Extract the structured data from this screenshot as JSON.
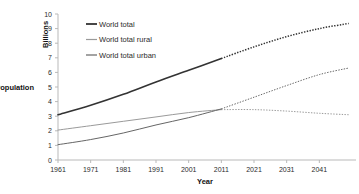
{
  "chart_data": {
    "type": "line",
    "title": "",
    "xlabel": "Year",
    "ylabel": "Population",
    "yunit": "Billions",
    "xlim": [
      1961,
      2051
    ],
    "ylim": [
      0,
      10
    ],
    "xticks": [
      "1961",
      "1971",
      "1981",
      "1991",
      "2001",
      "2011",
      "2021",
      "2031",
      "2041"
    ],
    "yticks": [
      "0",
      "1",
      "2",
      "3",
      "4",
      "5",
      "6",
      "7",
      "8",
      "9",
      "10"
    ],
    "grid": false,
    "legend_position": "upper-left-inside",
    "projection_start_year": 2011,
    "x": [
      1961,
      1971,
      1981,
      1991,
      2001,
      2011,
      2021,
      2031,
      2041,
      2050
    ],
    "series": [
      {
        "name": "World total",
        "color": "#333333",
        "values": [
          3.1,
          3.75,
          4.5,
          5.35,
          6.15,
          6.95,
          7.75,
          8.45,
          9.0,
          9.35
        ]
      },
      {
        "name": "World total rural",
        "color": "#9a9a9a",
        "values": [
          2.05,
          2.35,
          2.65,
          2.95,
          3.25,
          3.45,
          3.45,
          3.35,
          3.2,
          3.1
        ]
      },
      {
        "name": "World total urban",
        "color": "#666666",
        "values": [
          1.05,
          1.4,
          1.85,
          2.4,
          2.9,
          3.5,
          4.3,
          5.1,
          5.85,
          6.3
        ]
      }
    ]
  },
  "legend": {
    "items": [
      {
        "label": "World total",
        "color": "#333333"
      },
      {
        "label": "World total rural",
        "color": "#9a9a9a"
      },
      {
        "label": "World total urban",
        "color": "#666666"
      }
    ]
  }
}
